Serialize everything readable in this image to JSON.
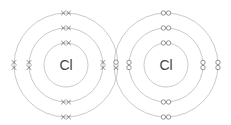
{
  "diagram": {
    "atoms": [
      {
        "symbol": "Cl",
        "center": [
          66,
          65
        ],
        "shell_radii": [
          22,
          37,
          52
        ],
        "electron_marker": "cross",
        "electrons_per_shell": [
          2,
          8,
          7
        ]
      },
      {
        "symbol": "Cl",
        "center": [
          166,
          65
        ],
        "shell_radii": [
          22,
          37,
          52
        ],
        "electron_marker": "dot",
        "electrons_per_shell": [
          2,
          8,
          7
        ]
      }
    ],
    "shared_pair": {
      "markers": [
        "dot",
        "cross"
      ],
      "position": [
        116,
        65
      ]
    },
    "colors": {
      "shell": "#bdbdbd",
      "marker": "#777777",
      "text": "#444444"
    }
  }
}
